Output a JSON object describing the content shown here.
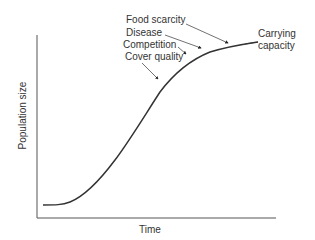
{
  "diagram": {
    "type": "logistic-growth-curve",
    "x_axis_label": "Time",
    "y_axis_label": "Population size",
    "asymptote_label_line1": "Carrying",
    "asymptote_label_line2": "capacity",
    "limiting_factors": [
      {
        "label": "Food scarcity"
      },
      {
        "label": "Disease"
      },
      {
        "label": "Competition"
      },
      {
        "label": "Cover quality"
      }
    ],
    "colors": {
      "line": "#333333",
      "axis": "#555555",
      "text": "#333333"
    }
  }
}
